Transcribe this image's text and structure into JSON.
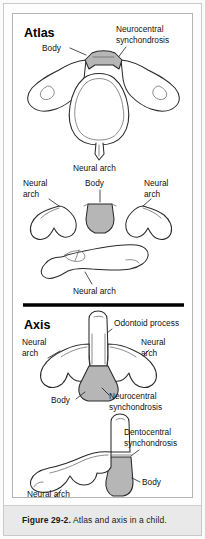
{
  "figure": {
    "caption_label": "Figure 29-2.",
    "caption_text": "Atlas and axis in a child."
  },
  "sections": {
    "atlas": {
      "heading": "Atlas",
      "labels": {
        "body": "Body",
        "neurocentral_line1": "Neurocentral",
        "neurocentral_line2": "synchondrosis",
        "neural_arch_bottom": "Neural arch",
        "neural_arch_left_line1": "Neural",
        "neural_arch_left_line2": "arch",
        "neural_arch_right_line1": "Neural",
        "neural_arch_right_line2": "arch",
        "body_mid": "Body",
        "neural_arch_lateral": "Neural arch"
      }
    },
    "axis": {
      "heading": "Axis",
      "labels": {
        "odontoid_process": "Odontoid process",
        "neural_arch_left_line1": "Neural",
        "neural_arch_left_line2": "arch",
        "neural_arch_right_line1": "Neural",
        "neural_arch_right_line2": "arch",
        "body": "Body",
        "neurocentral_line1": "Neurocentral",
        "neurocentral_line2": "synchondrosis",
        "dentocentral_line1": "Dentocentral",
        "dentocentral_line2": "synchondrosis",
        "body_lateral": "Body",
        "neural_arch_lateral": "Neural arch"
      }
    }
  },
  "colors": {
    "shade_fill": "#b6b6b6",
    "outline": "#2a2a2a",
    "caption_band": "#e9e9e9",
    "panel_background": "#ffffff"
  }
}
